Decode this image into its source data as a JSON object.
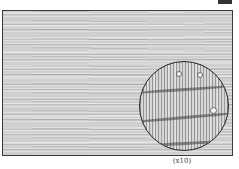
{
  "figure": {
    "caption": "(x10)",
    "colors": {
      "wood_base": "#cfcfcf",
      "lens_border": "#222222",
      "frame_border": "#3a3a3a",
      "caption_text": "#444444"
    },
    "lens": {
      "pores": 3,
      "growth_rings": 3
    }
  }
}
